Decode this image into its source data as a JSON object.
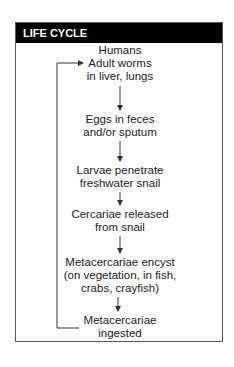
{
  "header": {
    "title": "LIFE CYCLE"
  },
  "nodes": [
    {
      "lines": [
        "Humans",
        "Adult worms",
        "in liver, lungs"
      ]
    },
    {
      "lines": [
        "Eggs in feces",
        "and/or sputum"
      ]
    },
    {
      "lines": [
        "Larvae penetrate",
        "freshwater snail"
      ]
    },
    {
      "lines": [
        "Cercariae released",
        "from snail"
      ]
    },
    {
      "lines": [
        "Metacercariae encyst",
        "(on vegetation, in fish,",
        "crabs, crayfish)"
      ]
    },
    {
      "lines": [
        "Metacercariae",
        "ingested"
      ]
    }
  ],
  "colors": {
    "header_bg": "#000000",
    "header_text": "#ffffff",
    "line": "#333333"
  }
}
